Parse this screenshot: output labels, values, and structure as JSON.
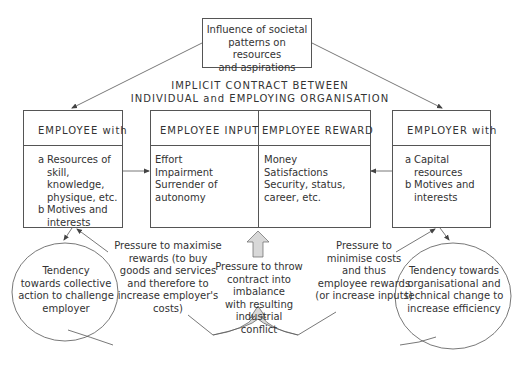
{
  "top_box": {
    "lines": [
      "Influence of societal",
      "patterns on resources",
      "and aspirations"
    ]
  },
  "contract_title": {
    "line1": "IMPLICIT CONTRACT BETWEEN",
    "line2": "INDIVIDUAL and EMPLOYING ORGANISATION"
  },
  "employee_box": {
    "header": "EMPLOYEE with",
    "items": [
      {
        "marker": "a",
        "lines": [
          "Resources of",
          "skill, knowledge,",
          "physique, etc."
        ]
      },
      {
        "marker": "b",
        "lines": [
          "Motives and",
          "interests"
        ]
      }
    ]
  },
  "contract_box": {
    "input_header": "EMPLOYEE INPUT",
    "reward_header": "EMPLOYEE REWARD",
    "inputs": [
      "Effort",
      "Impairment",
      "Surrender of",
      "autonomy"
    ],
    "rewards": [
      "Money",
      "Satisfactions",
      "Security, status,",
      "career, etc."
    ]
  },
  "employer_box": {
    "header": "EMPLOYER with",
    "items": [
      {
        "marker": "a",
        "lines": [
          "Capital",
          "resources"
        ]
      },
      {
        "marker": "b",
        "lines": [
          "Motives and",
          "interests"
        ]
      }
    ]
  },
  "left_circle": {
    "lines": [
      "Tendency",
      "towards collective",
      "action to challenge",
      "employer"
    ]
  },
  "right_circle": {
    "lines": [
      "Tendency towards",
      "organisational and",
      "technical change to",
      "increase efficiency"
    ]
  },
  "pressure_employee": {
    "lines": [
      "Pressure to maximise",
      "rewards (to buy",
      "goods and services",
      "and therefore to",
      "increase employer's",
      "costs)"
    ]
  },
  "pressure_conflict": {
    "lines": [
      "Pressure to throw",
      "contract into imbalance",
      "with resulting industrial",
      "conflict"
    ]
  },
  "pressure_employer": {
    "lines": [
      "Pressure to",
      "minimise costs",
      "and thus",
      "employee rewards",
      "(or increase inputs)"
    ]
  },
  "colors": {
    "line": "#555555",
    "arrow_fill": "#d8d8d8",
    "text": "#333333"
  }
}
